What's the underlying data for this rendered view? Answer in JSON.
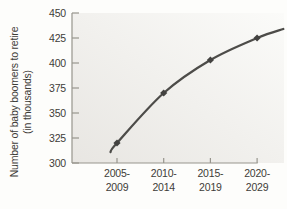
{
  "figure": {
    "background": "#fdfdfb"
  },
  "chart_data": {
    "type": "line",
    "title": "",
    "xlabel": "",
    "ylabel": "Number of baby boomers to retire (in thousands)",
    "ylabel_lines": [
      "Number of baby boomers to retire",
      "(in thousands)"
    ],
    "categories": [
      "2005-2009",
      "2010-2014",
      "2015-2019",
      "2020-2029"
    ],
    "category_label_lines": [
      [
        "2005-",
        "2009"
      ],
      [
        "2010-",
        "2014"
      ],
      [
        "2015-",
        "2019"
      ],
      [
        "2020-",
        "2029"
      ]
    ],
    "series": [
      {
        "name": "Baby boomers retiring (thousands)",
        "values": [
          320,
          370,
          403,
          425
        ]
      }
    ],
    "ylim": [
      300,
      450
    ],
    "ytick_step": 25,
    "ytick_labels": [
      "300",
      "325",
      "350",
      "375",
      "400",
      "425",
      "450"
    ],
    "grid": false,
    "legend_position": "none",
    "marker": "diamond",
    "curve_overshoot": {
      "start_x": -0.14,
      "start_value": 311,
      "end_x": 3.56,
      "end_value": 434
    },
    "colors": {
      "line": "#4d4c49",
      "marker": "#434240",
      "axis": "#97958d",
      "tick_text": "#3d3c38",
      "plot_bg_dark": "#e8e6e2",
      "plot_bg_light": "#fbfbf9"
    }
  }
}
